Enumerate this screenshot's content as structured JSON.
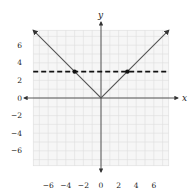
{
  "chart_data": {
    "type": "line",
    "title": "",
    "xlabel": "x",
    "ylabel": "y",
    "xlim": [
      -7.7,
      7.7
    ],
    "ylim": [
      -7.7,
      7.7
    ],
    "grid": true,
    "x_ticks": [
      -6,
      -4,
      -2,
      0,
      2,
      4,
      6
    ],
    "y_ticks": [
      6,
      4,
      2,
      0,
      -2,
      -4,
      -6
    ],
    "x_tick_labels": [
      "−6",
      "−4",
      "−2",
      "0",
      "2",
      "4",
      "6"
    ],
    "y_tick_labels": [
      "6",
      "4",
      "2",
      "0",
      "−2",
      "−4",
      "−6"
    ],
    "series": [
      {
        "name": "y = |x|",
        "style": "solid",
        "color": "#555555",
        "arrows": "both-ends",
        "points": [
          [
            -7.7,
            7.7
          ],
          [
            0,
            0
          ],
          [
            7.7,
            7.7
          ]
        ]
      },
      {
        "name": "y = 3",
        "style": "dashed",
        "color": "#111111",
        "points": [
          [
            -7.7,
            3
          ],
          [
            7.7,
            3
          ]
        ]
      }
    ],
    "marked_points": [
      [
        -3,
        3
      ],
      [
        3,
        3
      ]
    ]
  },
  "labels": {
    "x_axis": "x",
    "y_axis": "y"
  }
}
